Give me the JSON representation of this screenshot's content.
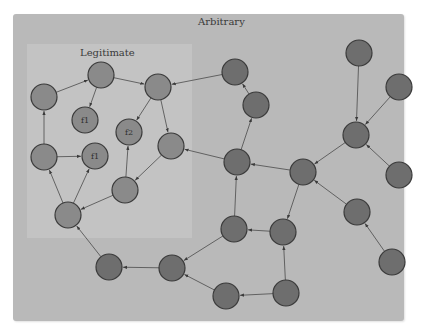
{
  "diagram": {
    "regions": [
      {
        "id": "arbitrary",
        "label": "Arbitrary"
      },
      {
        "id": "legitimate",
        "label": "Legitimate"
      }
    ],
    "colors": {
      "arbitrary_bg": "#b9b9b9",
      "legitimate_bg": "#c3c3c3",
      "node_fill": "#6e6e6e",
      "legit_node_fill": "#8a8a8a",
      "node_stroke": "#3a3a3a",
      "edge": "#4a4a4a"
    },
    "nodes": [
      {
        "id": "A",
        "x": 44,
        "y": 97,
        "label": "",
        "region": "legitimate"
      },
      {
        "id": "B",
        "x": 101,
        "y": 75,
        "label": "",
        "region": "legitimate"
      },
      {
        "id": "C",
        "x": 158,
        "y": 87,
        "label": "",
        "region": "legitimate"
      },
      {
        "id": "F1a",
        "x": 85,
        "y": 120,
        "label": "f1",
        "region": "legitimate"
      },
      {
        "id": "F2",
        "x": 129,
        "y": 132,
        "label": "f2",
        "region": "legitimate"
      },
      {
        "id": "D",
        "x": 44,
        "y": 157,
        "label": "",
        "region": "legitimate"
      },
      {
        "id": "F1b",
        "x": 95,
        "y": 156,
        "label": "f1",
        "region": "legitimate"
      },
      {
        "id": "E",
        "x": 171,
        "y": 146,
        "label": "",
        "region": "legitimate"
      },
      {
        "id": "G",
        "x": 125,
        "y": 190,
        "label": "",
        "region": "legitimate"
      },
      {
        "id": "H",
        "x": 68,
        "y": 215,
        "label": "",
        "region": "legitimate"
      },
      {
        "id": "I",
        "x": 235,
        "y": 72,
        "label": "",
        "region": "arbitrary"
      },
      {
        "id": "J",
        "x": 256,
        "y": 105,
        "label": "",
        "region": "arbitrary"
      },
      {
        "id": "K",
        "x": 237,
        "y": 162,
        "label": "",
        "region": "arbitrary"
      },
      {
        "id": "L",
        "x": 303,
        "y": 172,
        "label": "",
        "region": "arbitrary"
      },
      {
        "id": "M",
        "x": 359,
        "y": 53,
        "label": "",
        "region": "arbitrary"
      },
      {
        "id": "N",
        "x": 399,
        "y": 87,
        "label": "",
        "region": "arbitrary"
      },
      {
        "id": "O",
        "x": 356,
        "y": 135,
        "label": "",
        "region": "arbitrary"
      },
      {
        "id": "P",
        "x": 399,
        "y": 175,
        "label": "",
        "region": "arbitrary"
      },
      {
        "id": "Q",
        "x": 283,
        "y": 232,
        "label": "",
        "region": "arbitrary"
      },
      {
        "id": "R",
        "x": 234,
        "y": 229,
        "label": "",
        "region": "arbitrary"
      },
      {
        "id": "S",
        "x": 357,
        "y": 212,
        "label": "",
        "region": "arbitrary"
      },
      {
        "id": "T",
        "x": 392,
        "y": 262,
        "label": "",
        "region": "arbitrary"
      },
      {
        "id": "U",
        "x": 172,
        "y": 268,
        "label": "",
        "region": "arbitrary"
      },
      {
        "id": "V",
        "x": 109,
        "y": 267,
        "label": "",
        "region": "arbitrary"
      },
      {
        "id": "W",
        "x": 226,
        "y": 296,
        "label": "",
        "region": "arbitrary"
      },
      {
        "id": "X",
        "x": 286,
        "y": 293,
        "label": "",
        "region": "arbitrary"
      }
    ],
    "edges": [
      {
        "from": "A",
        "to": "B"
      },
      {
        "from": "B",
        "to": "F1a"
      },
      {
        "from": "B",
        "to": "C"
      },
      {
        "from": "D",
        "to": "A"
      },
      {
        "from": "D",
        "to": "F1b"
      },
      {
        "from": "H",
        "to": "D"
      },
      {
        "from": "H",
        "to": "F1b"
      },
      {
        "from": "G",
        "to": "H"
      },
      {
        "from": "G",
        "to": "F2"
      },
      {
        "from": "C",
        "to": "F2"
      },
      {
        "from": "C",
        "to": "E"
      },
      {
        "from": "E",
        "to": "G"
      },
      {
        "from": "I",
        "to": "C"
      },
      {
        "from": "J",
        "to": "I"
      },
      {
        "from": "K",
        "to": "J"
      },
      {
        "from": "K",
        "to": "E"
      },
      {
        "from": "L",
        "to": "K"
      },
      {
        "from": "O",
        "to": "L"
      },
      {
        "from": "M",
        "to": "O"
      },
      {
        "from": "N",
        "to": "O"
      },
      {
        "from": "P",
        "to": "O"
      },
      {
        "from": "L",
        "to": "Q"
      },
      {
        "from": "Q",
        "to": "R"
      },
      {
        "from": "R",
        "to": "K"
      },
      {
        "from": "S",
        "to": "L"
      },
      {
        "from": "T",
        "to": "S"
      },
      {
        "from": "R",
        "to": "U"
      },
      {
        "from": "U",
        "to": "V"
      },
      {
        "from": "V",
        "to": "H"
      },
      {
        "from": "W",
        "to": "U"
      },
      {
        "from": "X",
        "to": "W"
      },
      {
        "from": "X",
        "to": "Q"
      }
    ]
  }
}
